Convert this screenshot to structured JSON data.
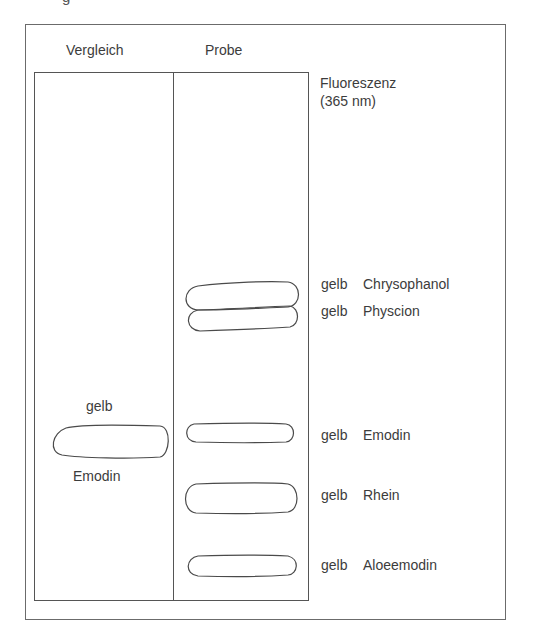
{
  "cropped_caption": "g",
  "columns": {
    "reference": "Vergleich",
    "sample": "Probe"
  },
  "detection": {
    "line1": "Fluoreszenz",
    "line2": "(365 nm)"
  },
  "reference_spot": {
    "color": "gelb",
    "compound": "Emodin"
  },
  "sample_spots": [
    {
      "color": "gelb",
      "compound": "Chrysophanol"
    },
    {
      "color": "gelb",
      "compound": "Physcion"
    },
    {
      "color": "gelb",
      "compound": "Emodin"
    },
    {
      "color": "gelb",
      "compound": "Rhein"
    },
    {
      "color": "gelb",
      "compound": "Aloeemodin"
    }
  ],
  "colors": {
    "line": "#555555",
    "text": "#3c3c3c",
    "background": "#ffffff"
  }
}
